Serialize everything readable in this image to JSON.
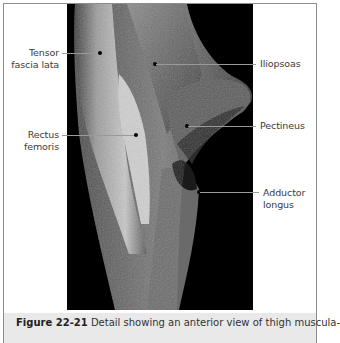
{
  "figure": {
    "photo_description": "Dissected anterior thigh musculature, grayscale on black background",
    "labels": {
      "tensor_fascia_lata": [
        "Tensor",
        "fascia lata"
      ],
      "rectus_femoris": [
        "Rectus",
        "femoris"
      ],
      "iliopsoas": [
        "Iliopsoas"
      ],
      "pectineus": [
        "Pectineus"
      ],
      "adductor_longus": [
        "Adductor",
        "longus"
      ]
    },
    "caption": {
      "number": "Figure 22-21",
      "text": " Detail showing an anterior view of thigh muscula-"
    }
  },
  "colors": {
    "background": "#ffffff",
    "photo_background": "#000000",
    "caption_background": "#e9e9e9",
    "border": "#8c8c8c"
  }
}
